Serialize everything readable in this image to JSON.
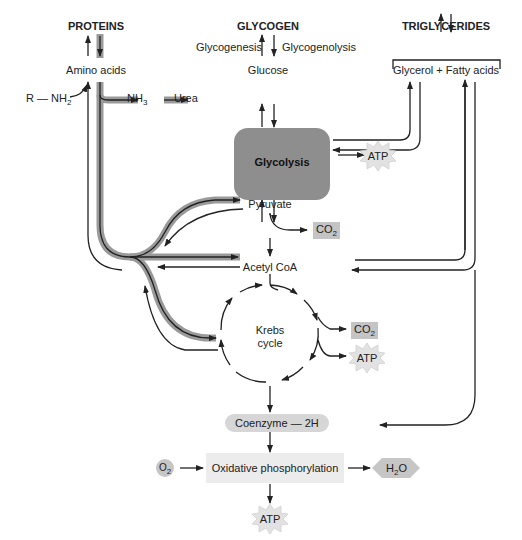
{
  "nodes": {
    "proteins": "PROTEINS",
    "glycogen": "GLYCOGEN",
    "triglycerides": "TRIGLYCERIDES",
    "amino_acids": "Amino acids",
    "glucose": "Glucose",
    "glycerol_fatty_acids": "Glycerol + Fatty acids",
    "glycogenesis": "Glycogenesis",
    "glycogenolysis": "Glycogenolysis",
    "r_nh2": "R — NH",
    "r_nh2_sub": "2",
    "nh3": "NH",
    "nh3_sub": "3",
    "urea": "Urea",
    "glycolysis": "Glycolysis",
    "atp_glycolysis": "ATP",
    "pyruvate": "Pyruvate",
    "co2_pyruvate": "CO",
    "co2_sub": "2",
    "acetyl_coa": "Acetyl CoA",
    "krebs_line1": "Krebs",
    "krebs_line2": "cycle",
    "co2_krebs": "CO",
    "atp_krebs": "ATP",
    "coenzyme": "Coenzyme — 2H",
    "o2": "O",
    "o2_sub": "2",
    "oxidative": "Oxidative phosphorylation",
    "h2o_h": "H",
    "h2o_sub": "2",
    "h2o_o": "O",
    "atp_oxidative": "ATP"
  },
  "colors": {
    "glycolysis_box": "#8e8e8e",
    "protein_path_highlight": "#9a9a9a",
    "co2_box": "#c4c4c4",
    "coenzyme_pill": "#d6d6d6",
    "oxidative_box": "#ececec",
    "atp_burst": "#e2e2e2",
    "line": "#222222"
  }
}
